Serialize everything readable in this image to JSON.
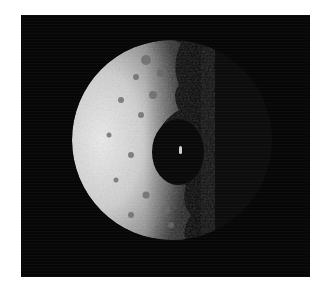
{
  "image": {
    "subject": "cratered moon crescent with large impact crater on the terminator",
    "colors": {
      "background": "#ffffff",
      "space": "#070707",
      "surface_bright": "#e6e6e6",
      "surface_mid": "#a8a8a8",
      "crater_shadow": "#0a0a0a"
    }
  }
}
